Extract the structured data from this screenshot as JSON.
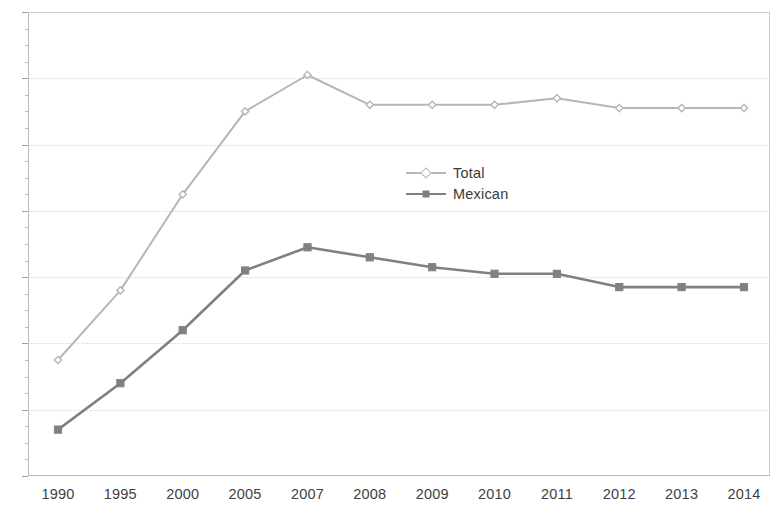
{
  "chart_data": {
    "type": "line",
    "title": "",
    "subtitle": "",
    "xlabel": "",
    "ylabel": "",
    "categories": [
      "1990",
      "1995",
      "2000",
      "2005",
      "2007",
      "2008",
      "2009",
      "2010",
      "2011",
      "2012",
      "2013",
      "2014"
    ],
    "series": [
      {
        "name": "Total",
        "color": "#b6b6b6",
        "marker": "diamond-open",
        "values": [
          3.5,
          5.6,
          8.5,
          11.0,
          12.1,
          11.2,
          11.2,
          11.2,
          11.4,
          11.1,
          11.1,
          11.1
        ]
      },
      {
        "name": "Mexican",
        "color": "#808080",
        "marker": "square",
        "values": [
          1.4,
          2.8,
          4.4,
          6.2,
          6.9,
          6.6,
          6.3,
          6.1,
          6.1,
          5.7,
          5.7,
          5.7
        ]
      }
    ],
    "ylim": [
      0,
      14
    ],
    "yticks": [
      0,
      2,
      4,
      6,
      8,
      10,
      12,
      14
    ],
    "yminor_step": 0.5,
    "grid": true,
    "grid_axis": "y",
    "legend_position": "center-left-inside",
    "legend": [
      "Total",
      "Mexican"
    ]
  },
  "axes": {
    "y_tick_labels": [
      "0",
      "2",
      "4",
      "6",
      "8",
      "10",
      "12",
      "14"
    ],
    "x_tick_labels": [
      "1990",
      "1995",
      "2000",
      "2005",
      "2007",
      "2008",
      "2009",
      "2010",
      "2011",
      "2012",
      "2013",
      "2014"
    ]
  },
  "colors": {
    "total": "#b6b6b6",
    "mexican": "#808080",
    "grid": "#d9d9dd",
    "axis": "#b9b9b9",
    "text": "#3f3f3f",
    "background": "#ffffff"
  }
}
